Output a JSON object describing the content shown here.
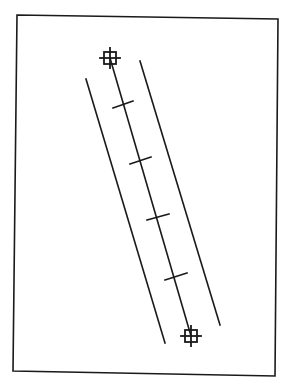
{
  "diagram": {
    "stroke_color": "#1a1a1a",
    "background": "#ffffff",
    "frame": {
      "points": [
        [
          17,
          15
        ],
        [
          278,
          19
        ],
        [
          275,
          376
        ],
        [
          13,
          371
        ]
      ]
    },
    "centerline": {
      "start": [
        110,
        58
      ],
      "end": [
        191,
        336
      ]
    },
    "boundary_lines": [
      {
        "name": "left-boundary",
        "start": [
          86,
          79
        ],
        "end": [
          165,
          343
        ]
      },
      {
        "name": "right-boundary",
        "start": [
          140,
          61
        ],
        "end": [
          220,
          325
        ]
      }
    ],
    "ticks": [
      {
        "start": [
          113,
          108
        ],
        "end": [
          133,
          101
        ]
      },
      {
        "start": [
          130,
          164
        ],
        "end": [
          151,
          157
        ]
      },
      {
        "start": [
          147,
          220
        ],
        "end": [
          169,
          214
        ]
      },
      {
        "start": [
          165,
          280
        ],
        "end": [
          187,
          273
        ]
      }
    ],
    "markers": [
      {
        "name": "top-crosshair",
        "center": [
          110,
          58
        ],
        "box": 12,
        "arm": 10
      },
      {
        "name": "bottom-crosshair",
        "center": [
          191,
          336
        ],
        "box": 12,
        "arm": 10
      }
    ]
  }
}
